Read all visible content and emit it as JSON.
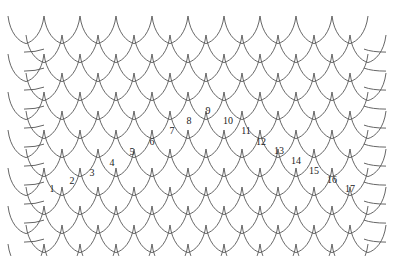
{
  "diagram": {
    "type": "scale-pattern",
    "line_color": "#555555",
    "background": "#ffffff",
    "scale_width": 36,
    "row_height": 19,
    "rows": 13,
    "labels": [
      {
        "text": "1",
        "x": 52,
        "y": 189
      },
      {
        "text": "2",
        "x": 72,
        "y": 181
      },
      {
        "text": "3",
        "x": 92,
        "y": 173
      },
      {
        "text": "4",
        "x": 112,
        "y": 163
      },
      {
        "text": "5",
        "x": 132,
        "y": 152
      },
      {
        "text": "6",
        "x": 152,
        "y": 142
      },
      {
        "text": "7",
        "x": 172,
        "y": 131
      },
      {
        "text": "8",
        "x": 189,
        "y": 121
      },
      {
        "text": "9",
        "x": 208,
        "y": 111
      },
      {
        "text": "10",
        "x": 228,
        "y": 121
      },
      {
        "text": "11",
        "x": 246,
        "y": 131
      },
      {
        "text": "12",
        "x": 261,
        "y": 142
      },
      {
        "text": "13",
        "x": 279,
        "y": 151
      },
      {
        "text": "14",
        "x": 296,
        "y": 161
      },
      {
        "text": "15",
        "x": 314,
        "y": 171
      },
      {
        "text": "16",
        "x": 332,
        "y": 180
      },
      {
        "text": "17",
        "x": 350,
        "y": 189
      }
    ]
  }
}
